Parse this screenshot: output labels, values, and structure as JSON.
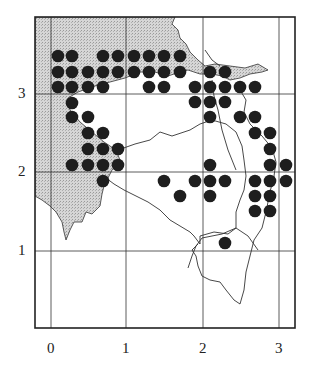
{
  "map": {
    "frame": {
      "x0": 35,
      "y0": 17,
      "x1": 295,
      "y1": 328
    },
    "grid": {
      "x_ticks": [
        {
          "value": "0",
          "px": 51
        },
        {
          "value": "1",
          "px": 126
        },
        {
          "value": "2",
          "px": 203
        },
        {
          "value": "3",
          "px": 279
        }
      ],
      "y_ticks": [
        {
          "value": "3",
          "px": 94
        },
        {
          "value": "2",
          "px": 172
        },
        {
          "value": "1",
          "px": 251
        }
      ]
    },
    "colors": {
      "land_shaded": "#c8c8c8",
      "dot": "#1e1e1e",
      "line": "#333333",
      "frame": "#222222"
    },
    "dot_radius": 6.3,
    "dots": [
      [
        58,
        56
      ],
      [
        72,
        56
      ],
      [
        103,
        56
      ],
      [
        118,
        56
      ],
      [
        134,
        56
      ],
      [
        149,
        56
      ],
      [
        164,
        56
      ],
      [
        180,
        56
      ],
      [
        58,
        72
      ],
      [
        72,
        72
      ],
      [
        88,
        72
      ],
      [
        103,
        72
      ],
      [
        118,
        72
      ],
      [
        134,
        72
      ],
      [
        149,
        72
      ],
      [
        164,
        72
      ],
      [
        180,
        72
      ],
      [
        210,
        72
      ],
      [
        225,
        72
      ],
      [
        58,
        87
      ],
      [
        72,
        87
      ],
      [
        88,
        87
      ],
      [
        103,
        87
      ],
      [
        149,
        87
      ],
      [
        164,
        87
      ],
      [
        195,
        87
      ],
      [
        210,
        87
      ],
      [
        225,
        87
      ],
      [
        240,
        87
      ],
      [
        255,
        87
      ],
      [
        72,
        103
      ],
      [
        195,
        102
      ],
      [
        210,
        102
      ],
      [
        225,
        102
      ],
      [
        72,
        117
      ],
      [
        88,
        117
      ],
      [
        210,
        117
      ],
      [
        240,
        117
      ],
      [
        255,
        117
      ],
      [
        88,
        133
      ],
      [
        103,
        133
      ],
      [
        255,
        133
      ],
      [
        270,
        133
      ],
      [
        88,
        149
      ],
      [
        103,
        149
      ],
      [
        118,
        149
      ],
      [
        270,
        149
      ],
      [
        72,
        165
      ],
      [
        88,
        165
      ],
      [
        103,
        165
      ],
      [
        118,
        165
      ],
      [
        210,
        165
      ],
      [
        270,
        165
      ],
      [
        286,
        165
      ],
      [
        103,
        181
      ],
      [
        164,
        181
      ],
      [
        195,
        181
      ],
      [
        210,
        181
      ],
      [
        225,
        181
      ],
      [
        255,
        181
      ],
      [
        270,
        181
      ],
      [
        286,
        181
      ],
      [
        180,
        196
      ],
      [
        210,
        196
      ],
      [
        255,
        196
      ],
      [
        270,
        196
      ],
      [
        255,
        211
      ],
      [
        270,
        211
      ],
      [
        225,
        243
      ]
    ]
  }
}
